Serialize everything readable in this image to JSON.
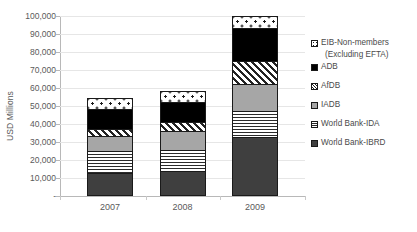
{
  "chart_data": {
    "type": "bar",
    "subtype": "stacked-column",
    "title": "",
    "xlabel": "",
    "ylabel": "USD Millions",
    "categories": [
      "2007",
      "2008",
      "2009"
    ],
    "ylim": [
      0,
      100000
    ],
    "ytick_values": [
      0,
      10000,
      20000,
      30000,
      40000,
      50000,
      60000,
      70000,
      80000,
      90000,
      100000
    ],
    "ytick_labels": [
      "-",
      "10,000",
      "20,000",
      "30,000",
      "40,000",
      "50,000",
      "60,000",
      "70,000",
      "80,000",
      "90,000",
      "100,000"
    ],
    "grid": true,
    "grid_axis": "y",
    "legend_position": "right",
    "stack_order_bottom_to_top": [
      "World Bank-IBRD",
      "World Bank-IDA",
      "IADB",
      "AfDB",
      "ADB",
      "EIB-Non-members (Excluding EFTA)"
    ],
    "series": [
      {
        "name": "World Bank-IBRD",
        "pattern": "solid-dark-gray",
        "color": "#3f3f3f",
        "values": [
          13000,
          14000,
          33000
        ]
      },
      {
        "name": "World Bank-IDA",
        "pattern": "horizontal-lines",
        "color": "#ffffff",
        "values": [
          12000,
          11500,
          14000
        ]
      },
      {
        "name": "IADB",
        "pattern": "solid-light-gray",
        "color": "#a6a6a6",
        "values": [
          8500,
          10500,
          15500
        ]
      },
      {
        "name": "AfDB",
        "pattern": "diagonal-hatch",
        "color": "#ffffff",
        "values": [
          3500,
          5000,
          12500
        ]
      },
      {
        "name": "ADB",
        "pattern": "solid-black",
        "color": "#000000",
        "values": [
          11500,
          11500,
          18500
        ]
      },
      {
        "name": "EIB-Non-members (Excluding EFTA)",
        "pattern": "dotted",
        "color": "#ffffff",
        "values": [
          6000,
          6000,
          6500
        ]
      }
    ],
    "totals": [
      54500,
      58500,
      100000
    ]
  },
  "axes": {
    "y_title": "USD Millions",
    "y_ticks": [
      {
        "label": "100,000",
        "value": 100000
      },
      {
        "label": "90,000",
        "value": 90000
      },
      {
        "label": "80,000",
        "value": 80000
      },
      {
        "label": "70,000",
        "value": 70000
      },
      {
        "label": "60,000",
        "value": 60000
      },
      {
        "label": "50,000",
        "value": 50000
      },
      {
        "label": "40,000",
        "value": 40000
      },
      {
        "label": "30,000",
        "value": 30000
      },
      {
        "label": "20,000",
        "value": 20000
      },
      {
        "label": "10,000",
        "value": 10000
      },
      {
        "label": "-",
        "value": 0
      }
    ],
    "x_ticks": [
      "2007",
      "2008",
      "2009"
    ]
  },
  "legend": {
    "items": [
      {
        "label": "EIB-Non-members",
        "label2": "(Excluding EFTA)",
        "swatch": "dotted-swatch"
      },
      {
        "label": "ADB",
        "label2": "",
        "swatch": "black-swatch"
      },
      {
        "label": "AfDB",
        "label2": "",
        "swatch": "hatch-swatch"
      },
      {
        "label": "IADB",
        "label2": "",
        "swatch": "light-gray-swatch"
      },
      {
        "label": "World Bank-IDA",
        "label2": "",
        "swatch": "lines-swatch"
      },
      {
        "label": "World Bank-IBRD",
        "label2": "",
        "swatch": "dark-gray-swatch"
      }
    ]
  }
}
